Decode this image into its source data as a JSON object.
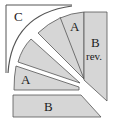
{
  "diagram": {
    "labels": {
      "c": "C",
      "a_top": "A",
      "b_rev_line1": "B",
      "b_rev_line2": "rev.",
      "a_left": "A",
      "b_bottom": "B"
    },
    "colors": {
      "fill": "#d6d6d6",
      "stroke": "#555555",
      "background": "#ffffff"
    }
  }
}
